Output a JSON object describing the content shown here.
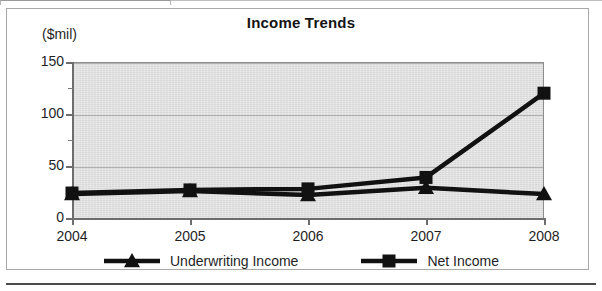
{
  "chart_data": {
    "type": "line",
    "title": "Income Trends",
    "ylabel": "($mil)",
    "xlabel": "",
    "categories": [
      "2004",
      "2005",
      "2006",
      "2007",
      "2008"
    ],
    "series": [
      {
        "name": "Underwriting Income",
        "marker": "triangle",
        "values": [
          23,
          26,
          22,
          29,
          23
        ]
      },
      {
        "name": "Net Income",
        "marker": "square",
        "values": [
          24,
          27,
          28,
          39,
          120
        ]
      }
    ],
    "ylim": [
      0,
      150
    ],
    "yticks": [
      0,
      50,
      100,
      150
    ],
    "ytick_labels": [
      "0",
      "50",
      "100",
      "150"
    ],
    "yminor_ticks": [
      25,
      75,
      125
    ],
    "grid": true,
    "grid_axis": "y",
    "legend_position": "bottom",
    "plot_background": "#d9d9d9",
    "series_color": "#111111"
  },
  "labels": {
    "y_unit": "($mil)",
    "title": "Income Trends"
  }
}
